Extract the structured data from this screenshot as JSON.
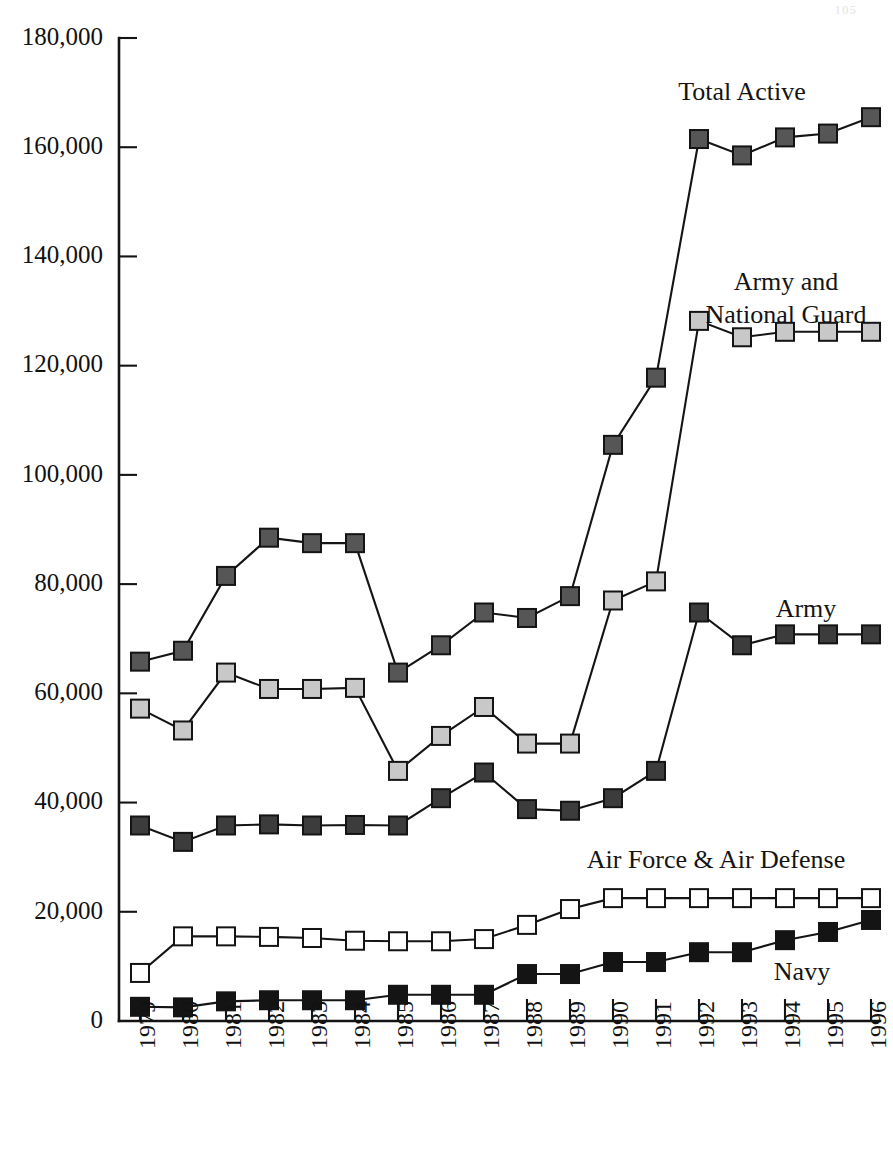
{
  "page": {
    "page_number": "105"
  },
  "chart_data": {
    "type": "line",
    "title": "",
    "xlabel": "",
    "ylabel": "",
    "grid": false,
    "legend_position": "inline-right-labels",
    "ylim": [
      0,
      180000
    ],
    "ytick_values": [
      0,
      20000,
      40000,
      60000,
      80000,
      100000,
      120000,
      140000,
      160000,
      180000
    ],
    "ytick_labels": [
      "0",
      "20,000",
      "40,000",
      "60,000",
      "80,000",
      "100,000",
      "120,000",
      "140,000",
      "160,000",
      "180,000"
    ],
    "categories": [
      "1979",
      "1980",
      "1981",
      "1982",
      "1983",
      "1984",
      "1985",
      "1986",
      "1987",
      "1988",
      "1989",
      "1990",
      "1991",
      "1992",
      "1993",
      "1994",
      "1995",
      "1996"
    ],
    "series": [
      {
        "name": "Total Active",
        "label": "Total Active",
        "marker": "filled-square-dark-gray",
        "marker_fill": "#565656",
        "marker_stroke": "#141414",
        "values": [
          65800,
          67800,
          81500,
          88500,
          87500,
          87500,
          63800,
          68800,
          74800,
          73800,
          77800,
          105500,
          117800,
          161500,
          158500,
          161800,
          162500,
          165500
        ]
      },
      {
        "name": "Army and National Guard",
        "label": "Army and\nNational Guard",
        "marker": "filled-square-light-gray",
        "marker_fill": "#c8c8c8",
        "marker_stroke": "#141414",
        "values": [
          57200,
          53200,
          63800,
          60800,
          60800,
          61000,
          45800,
          52200,
          57500,
          50800,
          50800,
          77000,
          80500,
          128200,
          125200,
          126200,
          126200,
          126200
        ]
      },
      {
        "name": "Army",
        "label": "Army",
        "marker": "filled-square-charcoal",
        "marker_fill": "#3c3c3c",
        "marker_stroke": "#141414",
        "values": [
          35800,
          32800,
          35800,
          36000,
          35800,
          35900,
          35800,
          40800,
          45500,
          38800,
          38500,
          40800,
          45800,
          74800,
          68800,
          70800,
          70800,
          70800
        ]
      },
      {
        "name": "Air Force & Air Defense",
        "label": "Air Force & Air Defense",
        "marker": "hollow-square-white",
        "marker_fill": "#ffffff",
        "marker_stroke": "#141414",
        "values": [
          8800,
          15500,
          15500,
          15400,
          15200,
          14700,
          14600,
          14600,
          15000,
          17600,
          20500,
          22500,
          22500,
          22500,
          22500,
          22500,
          22500,
          22500
        ]
      },
      {
        "name": "Navy",
        "label": "Navy",
        "marker": "filled-square-black",
        "marker_fill": "#141414",
        "marker_stroke": "#141414",
        "values": [
          2600,
          2500,
          3600,
          3800,
          3800,
          3800,
          4800,
          4800,
          4800,
          8600,
          8600,
          10800,
          10800,
          12600,
          12600,
          14800,
          16300,
          18500
        ]
      }
    ],
    "annotations": [
      {
        "name": "total-active-label",
        "text": "Total Active",
        "x": 742,
        "y": 100
      },
      {
        "name": "army-national-guard-label-line1",
        "text": "Army and",
        "x": 786,
        "y": 290
      },
      {
        "name": "army-national-guard-label-line2",
        "text": "National Guard",
        "x": 786,
        "y": 323
      },
      {
        "name": "army-label",
        "text": "Army",
        "x": 806,
        "y": 617
      },
      {
        "name": "air-force-label",
        "text": "Air Force & Air Defense",
        "x": 716,
        "y": 868
      },
      {
        "name": "navy-label",
        "text": "Navy",
        "x": 802,
        "y": 980
      }
    ]
  }
}
